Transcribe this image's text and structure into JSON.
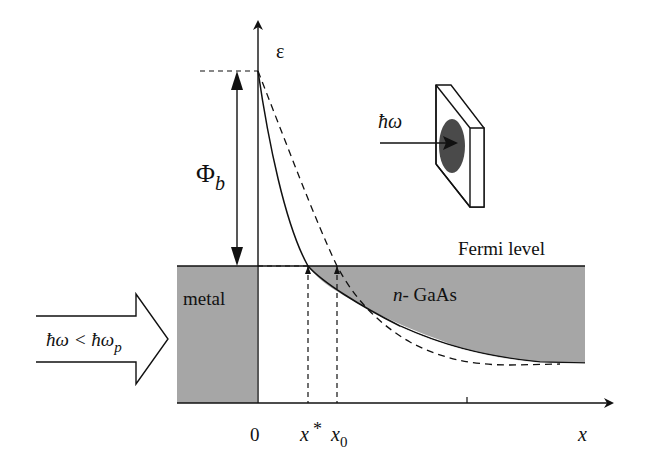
{
  "diagram": {
    "type": "band-diagram",
    "axes": {
      "y_label": "ε",
      "x_label": "x",
      "origin_label": "0",
      "x_star_label": "x",
      "x_star_sup": "*",
      "x0_label": "x",
      "x0_sub": "0"
    },
    "labels": {
      "barrier_main": "Φ",
      "barrier_sub": "b",
      "fermi_level": "Fermi level",
      "metal": "metal",
      "semiconductor_prefix": "n-",
      "semiconductor": " GaAs",
      "photon_inset": "ħω",
      "incident_main": "ħω < ħω",
      "incident_sub": "p"
    },
    "colors": {
      "shade": "#a6a6a6",
      "line": "#111111",
      "dark_spot": "#4a4a4a"
    }
  }
}
